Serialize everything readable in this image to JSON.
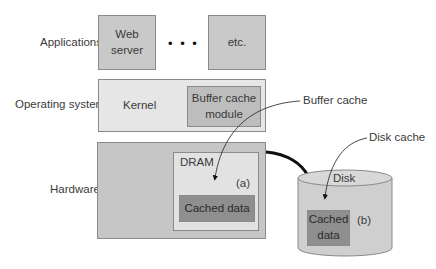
{
  "layers": {
    "applications": "Applications",
    "operating_system": "Operating system",
    "hardware": "Hardware"
  },
  "applications": {
    "web_server": "Web server",
    "ellipsis": "• • •",
    "etc": "etc."
  },
  "operating_system": {
    "kernel": "Kernel",
    "buffer_cache_module": "Buffer cache module"
  },
  "hardware": {
    "dram": "DRAM",
    "dram_marker": "(a)",
    "dram_cached_data": "Cached data",
    "disk": "Disk",
    "disk_marker": "(b)",
    "disk_cached_data": "Cached data"
  },
  "callouts": {
    "buffer_cache": "Buffer cache",
    "disk_cache": "Disk cache"
  },
  "colors": {
    "app_box": "#c9c9c9",
    "os_box": "#e6e6e6",
    "module_box": "#bdbdbd",
    "hardware_box": "#c6c6c6",
    "dram_box": "#e2e2e2",
    "cached_data_box": "#8f8f8f",
    "disk_body": "#cfcfcf",
    "connector": "#111111"
  }
}
